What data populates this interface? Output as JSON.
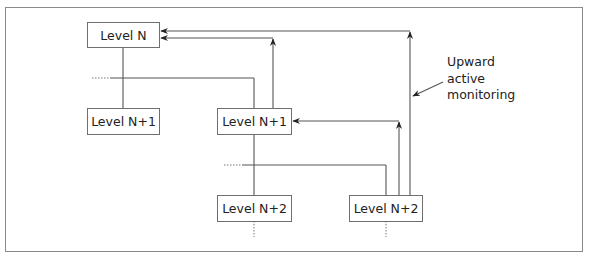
{
  "diagram": {
    "title_partial": "",
    "nodes": [
      {
        "id": "level-n",
        "label": "Level N"
      },
      {
        "id": "level-n1-left",
        "label": "Level N+1"
      },
      {
        "id": "level-n1-mid",
        "label": "Level N+1"
      },
      {
        "id": "level-n2-left",
        "label": "Level N+2"
      },
      {
        "id": "level-n2-right",
        "label": "Level N+2"
      }
    ],
    "annotation": {
      "line1": "Upward",
      "line2": "active",
      "line3": "monitoring"
    },
    "edges": [
      {
        "from": "level-n",
        "to": "level-n1-left",
        "type": "hierarchy"
      },
      {
        "from": "level-n",
        "to": "level-n1-mid",
        "type": "hierarchy"
      },
      {
        "from": "level-n1-mid",
        "to": "level-n2-left",
        "type": "hierarchy"
      },
      {
        "from": "level-n1-mid",
        "to": "level-n2-right",
        "type": "hierarchy"
      },
      {
        "from": "level-n1-mid",
        "to": "level-n",
        "type": "upward-monitoring"
      },
      {
        "from": "level-n2-right",
        "to": "level-n1-mid",
        "type": "upward-monitoring"
      },
      {
        "from": "level-n2-right",
        "to": "level-n",
        "type": "upward-monitoring"
      }
    ],
    "colors": {
      "line": "#555555",
      "frame": "#8a8a8a",
      "text": "#222222"
    }
  }
}
